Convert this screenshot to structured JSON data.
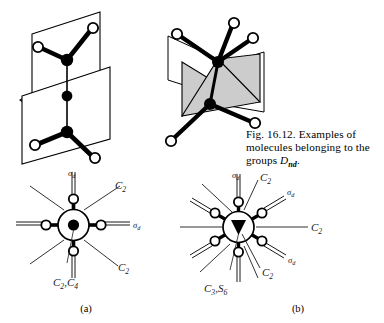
{
  "figure": {
    "caption": {
      "line1": "Fig. 16.12.  Examples of",
      "line2": "molecules belonging to the",
      "line3_prefix": "groups ",
      "line3_symbol": "D",
      "line3_subscript": "nd",
      "line3_suffix": "."
    },
    "subcaptions": {
      "a": "(a)",
      "b": "(b)"
    },
    "colors": {
      "ink": "#000000",
      "plane_fill": "#ffffff",
      "shaded_plane_fill": "#cccccc",
      "background": "#ffffff",
      "label_ink": "#1a1a1a"
    }
  },
  "panels": {
    "top_left": {
      "name": "staggered-ethane-like-molecule-with-two-mirror-planes",
      "atoms_dark": 4,
      "atoms_open": 4
    },
    "top_right": {
      "name": "staggered-molecule-with-shaded-dihedral-planes",
      "atoms_dark": 2,
      "atoms_open": 6
    },
    "bottom_left": {
      "label": "(a)",
      "projection_type": "newman-projection",
      "ligand_count": 4,
      "labels": [
        {
          "id": "sigma-d-top",
          "text": "σ",
          "sub": "d"
        },
        {
          "id": "c2-upper-right",
          "text": "C",
          "sub": "2"
        },
        {
          "id": "sigma-d-right",
          "text": "σ",
          "sub": "d"
        },
        {
          "id": "c2-lower-right",
          "text": "C",
          "sub": "2"
        },
        {
          "id": "principal-axis",
          "text": "C",
          "sub": "2",
          "text2": ",C",
          "sub2": "4"
        }
      ]
    },
    "bottom_right": {
      "label": "(b)",
      "projection_type": "newman-projection",
      "ligand_count": 6,
      "labels": [
        {
          "id": "sigma-d-top",
          "text": "σ",
          "sub": "d"
        },
        {
          "id": "c2-top-right",
          "text": "C",
          "sub": "2"
        },
        {
          "id": "sigma-d-upper-right",
          "text": "σ",
          "sub": "d"
        },
        {
          "id": "c2-right",
          "text": "C",
          "sub": "2"
        },
        {
          "id": "sigma-d-lower-right",
          "text": "σ",
          "sub": "d"
        },
        {
          "id": "c2-bottom-right",
          "text": "C",
          "sub": "2"
        },
        {
          "id": "principal-axis",
          "text": "C",
          "sub": "3",
          "text2": ",S",
          "sub2": "6"
        }
      ]
    }
  }
}
